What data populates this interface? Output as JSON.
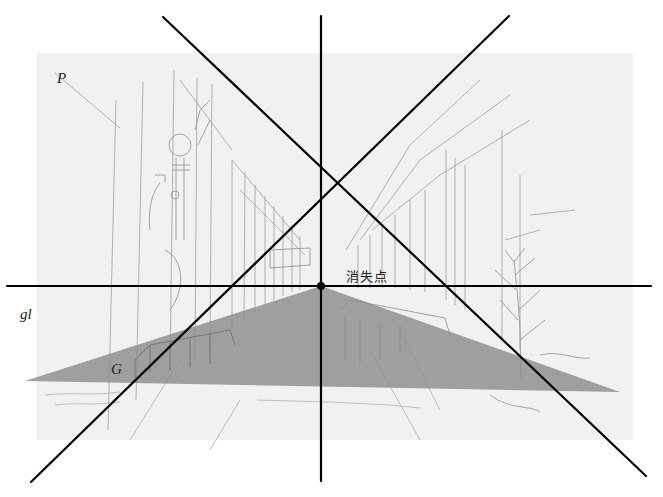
{
  "figure": {
    "labels": {
      "picture_plane": "P",
      "ground_line": "gl",
      "ground_plane": "G",
      "vanishing_point": "消失点"
    },
    "colors": {
      "background": "#ffffff",
      "sketch_paper": "#f1f1f1",
      "sketch_lines": "#9a9a9a",
      "ground_plane_fill": "#8c8c8c",
      "guide_lines": "#000000"
    },
    "vanishing_point": {
      "x": 321,
      "y": 286
    },
    "sketch_area": {
      "x": 37,
      "y": 53,
      "width": 596,
      "height": 387
    },
    "ground_triangle": {
      "left": [
        25,
        381
      ],
      "right": [
        620,
        392
      ],
      "apex": [
        321,
        286
      ]
    },
    "guide_lines": [
      {
        "name": "horizon-line",
        "from": [
          7,
          286
        ],
        "to": [
          651,
          286
        ]
      },
      {
        "name": "vertical-line",
        "from": [
          321,
          16
        ],
        "to": [
          321,
          481
        ]
      },
      {
        "name": "diagonal-topleft-bottomright",
        "from": [
          163,
          17
        ],
        "to": [
          646,
          476
        ]
      },
      {
        "name": "diagonal-topright-bottomleft",
        "from": [
          509,
          16
        ],
        "to": [
          31,
          482
        ]
      }
    ]
  }
}
